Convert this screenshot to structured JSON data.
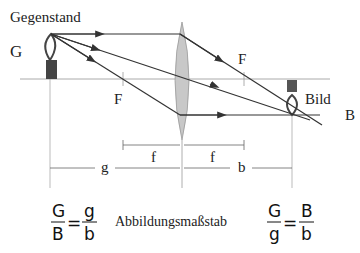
{
  "labels": {
    "object_title": "Gegenstand",
    "object_symbol": "G",
    "focal_left": "F",
    "focal_right": "F",
    "image_title": "Bild",
    "image_symbol": "B",
    "dim_f_left": "f",
    "dim_f_right": "f",
    "dim_g": "g",
    "dim_b": "b"
  },
  "formulas": {
    "left": {
      "num1": "G",
      "den1": "B",
      "eq": "=",
      "num2": "g",
      "den2": "b"
    },
    "caption": "Abbildungsmaßstab",
    "right": {
      "num1": "G",
      "den1": "g",
      "eq": "=",
      "num2": "B",
      "den2": "b"
    }
  },
  "colors": {
    "lens": "#c8c8c8",
    "ray": "#333333",
    "axis": "#999999"
  }
}
